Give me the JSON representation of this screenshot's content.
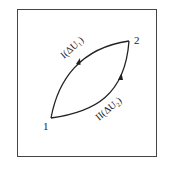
{
  "diagram": {
    "points": [
      {
        "id": "1",
        "label": "1"
      },
      {
        "id": "2",
        "label": "2"
      }
    ],
    "paths": [
      {
        "id": "I",
        "label": "I(ΔU₁)",
        "from": "1",
        "to": "2",
        "side": "upper-left"
      },
      {
        "id": "II",
        "label": "II(ΔU₂)",
        "from": "1",
        "to": "2",
        "side": "lower-right"
      }
    ]
  }
}
